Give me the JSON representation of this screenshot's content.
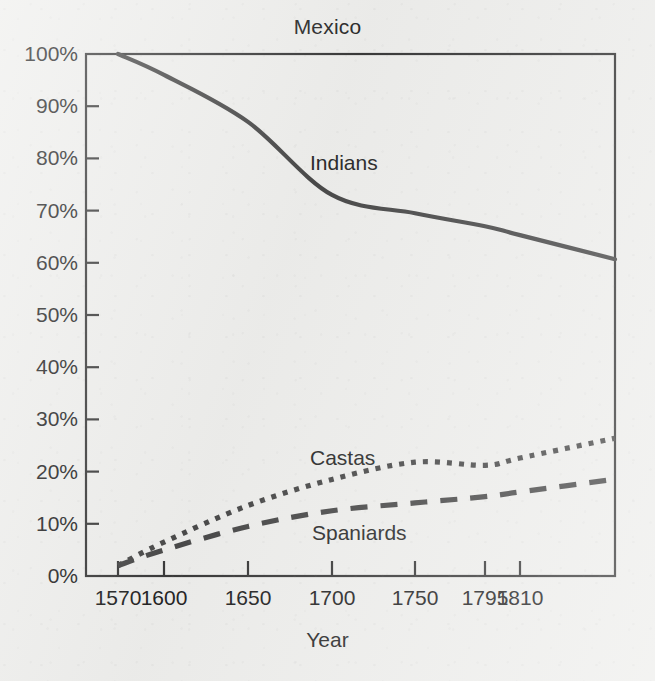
{
  "chart_data": {
    "type": "line",
    "title": "Mexico",
    "xlabel": "Year",
    "ylabel": "",
    "categories": [
      "1570",
      "1600",
      "1650",
      "1700",
      "1750",
      "1795",
      "1810"
    ],
    "x_tick_labels": [
      "1570",
      "1600",
      "1650",
      "1700",
      "1750",
      "1795",
      "1810"
    ],
    "y_tick_labels": [
      "0%",
      "10%",
      "20%",
      "30%",
      "40%",
      "50%",
      "60%",
      "70%",
      "80%",
      "90%",
      "100%"
    ],
    "y_tick_values": [
      0,
      10,
      20,
      30,
      40,
      50,
      60,
      70,
      80,
      90,
      100
    ],
    "ylim": [
      0,
      100
    ],
    "grid": false,
    "legend_position": "inline-annotations",
    "series": [
      {
        "name": "Indians",
        "line_style": "solid",
        "color": "#4a4a4a",
        "values": [
          100,
          96,
          87,
          73,
          69.5,
          67,
          65.3
        ],
        "label_x": 310,
        "label_y": 151
      },
      {
        "name": "Castas",
        "line_style": "dotted",
        "color": "#4a4a4a",
        "values": [
          2,
          6.5,
          13.5,
          18.5,
          21.8,
          21.2,
          22.6
        ],
        "label_x": 310,
        "label_y": 446
      },
      {
        "name": "Spaniards",
        "line_style": "dashed",
        "color": "#4a4a4a",
        "values": [
          2,
          5,
          9.5,
          12.5,
          14,
          15.2,
          16.1
        ],
        "label_x": 312,
        "label_y": 521
      }
    ],
    "annotations": [
      "Indians",
      "Castas",
      "Spaniards"
    ],
    "axis_color": "#3a3a3a",
    "background_color": "#eeeeec"
  },
  "plot_geometry": {
    "left": 86,
    "right": 615,
    "top": 54,
    "bottom": 576,
    "x_tick_px": [
      118,
      164,
      248,
      332,
      415,
      485,
      520
    ],
    "y_tick_px": [
      576,
      523.8,
      471.6,
      419.4,
      367.2,
      315,
      262.8,
      210.6,
      158.4,
      106.2,
      54
    ]
  }
}
